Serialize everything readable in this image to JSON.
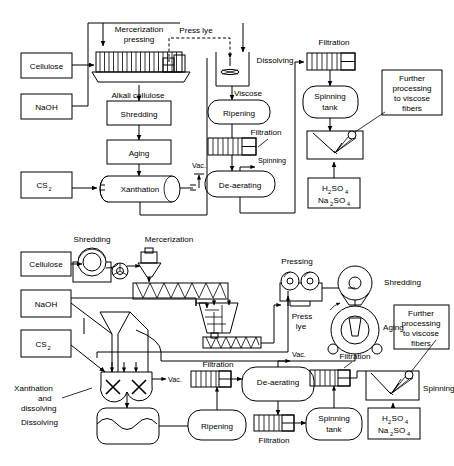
{
  "figure": {
    "background_color": "#ffffff",
    "line_color": "#000000",
    "diagram_count": 2
  },
  "diagram_top": {
    "name": "Batch viscose process block flow diagram",
    "boxes": [
      {
        "id": "cellulose",
        "label": "Cellulose"
      },
      {
        "id": "naoh",
        "label": "NaOH"
      },
      {
        "id": "cs2",
        "label": "CS",
        "sub": "2"
      },
      {
        "id": "shredding",
        "label": "Shredding"
      },
      {
        "id": "aging",
        "label": "Aging"
      },
      {
        "id": "further",
        "line1": "Further",
        "line2": "processing",
        "line3": "to viscose",
        "line4": "fibers"
      },
      {
        "id": "acid",
        "line1": "H",
        "sub1": "2",
        "mid1": "SO",
        "sub2": "4",
        "line2": "Na",
        "sub3": "2",
        "mid2": "SO",
        "sub4": "4"
      }
    ],
    "vessels": [
      {
        "id": "xanthation",
        "label": "Xanthation"
      },
      {
        "id": "ripening",
        "label": "Ripening"
      },
      {
        "id": "deaerating",
        "label": "De-aerating"
      },
      {
        "id": "spinning-tank",
        "line1": "Spinning",
        "line2": "tank"
      }
    ],
    "labels": [
      {
        "id": "mercerization",
        "line1": "Mercerization",
        "line2": "pressing"
      },
      {
        "id": "press-lye",
        "text": "Press lye"
      },
      {
        "id": "alkali-cellulose",
        "text": "Alkali cellulose"
      },
      {
        "id": "dissolving",
        "text": "Dissolving"
      },
      {
        "id": "viscose",
        "text": "Viscose"
      },
      {
        "id": "filtration-1",
        "text": "Filtration"
      },
      {
        "id": "filtration-2",
        "text": "Filtration"
      },
      {
        "id": "vac-1",
        "text": "Vac."
      },
      {
        "id": "vac-2",
        "text": "Vac."
      },
      {
        "id": "spinning",
        "text": "Spinning"
      }
    ]
  },
  "diagram_bottom": {
    "name": "Continuous viscose process equipment flow diagram",
    "boxes": [
      {
        "id": "cellulose",
        "label": "Cellulose"
      },
      {
        "id": "naoh",
        "label": "NaOH"
      },
      {
        "id": "cs2",
        "label": "CS",
        "sub": "2"
      },
      {
        "id": "further",
        "line1": "Further",
        "line2": "processing",
        "line3": "to viscose",
        "line4": "fibers"
      },
      {
        "id": "acid",
        "line1": "H",
        "sub1": "2",
        "mid1": "SO",
        "sub2": "4",
        "line2": "Na",
        "sub3": "2",
        "mid2": "SO",
        "sub4": "4"
      }
    ],
    "vessels": [
      {
        "id": "dissolving",
        "label": "Dissolving"
      },
      {
        "id": "ripening",
        "label": "Ripening"
      },
      {
        "id": "deaerating",
        "label": "De-aerating"
      },
      {
        "id": "spinning-tank",
        "line1": "Spinning",
        "line2": "tank"
      }
    ],
    "labels": [
      {
        "id": "shredding-1",
        "text": "Shredding"
      },
      {
        "id": "mercerization",
        "text": "Mercerization"
      },
      {
        "id": "pressing",
        "text": "Pressing"
      },
      {
        "id": "shredding-2",
        "text": "Shredding"
      },
      {
        "id": "press-lye",
        "line1": "Press",
        "line2": "lye"
      },
      {
        "id": "aging",
        "text": "Aging"
      },
      {
        "id": "xanthation",
        "line1": "Xanthation",
        "line2": "and",
        "line3": "dissolving"
      },
      {
        "id": "vac",
        "text": "Vac."
      },
      {
        "id": "filtration-1",
        "text": "Filtration"
      },
      {
        "id": "filtration-2",
        "text": "Filtration"
      },
      {
        "id": "filtration-3",
        "text": "Filtration"
      },
      {
        "id": "spinning",
        "text": "Spinning"
      }
    ]
  }
}
